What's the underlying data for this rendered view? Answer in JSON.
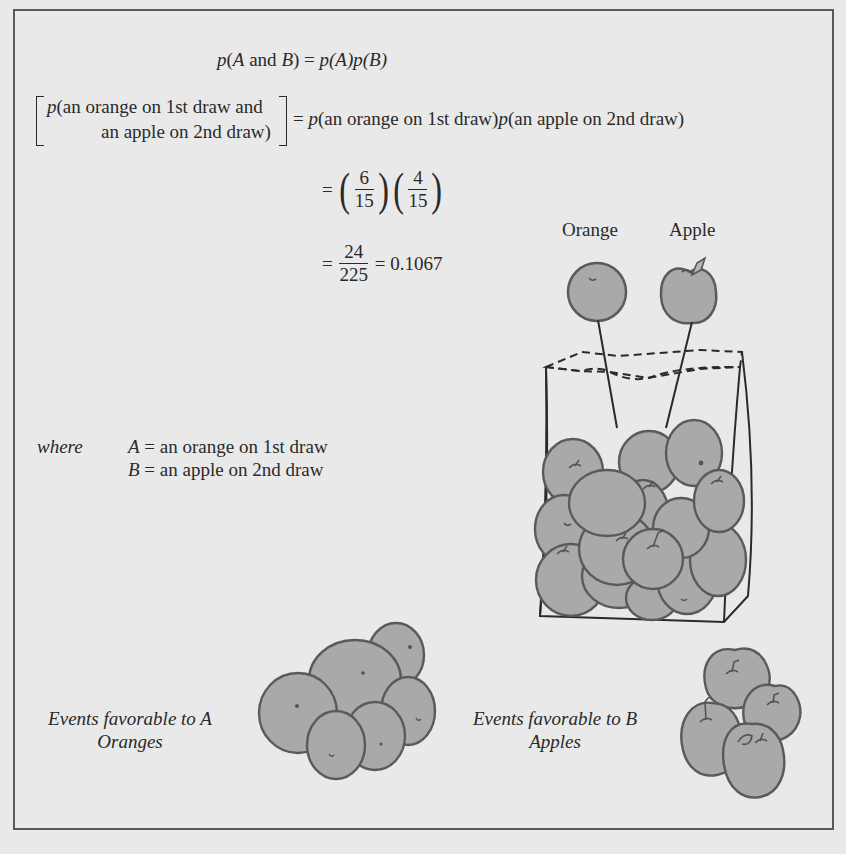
{
  "equations": {
    "rule": {
      "lhs_p": "p",
      "lhs_open": "(",
      "lhs_A": "A",
      "lhs_and": " and ",
      "lhs_B": "B",
      "lhs_close": ")",
      "eq": " = ",
      "rhs": "p(A)p(B)"
    },
    "applied": {
      "bracket_line1_p": "p",
      "bracket_line1_rest": "(an orange on 1st draw and",
      "bracket_line2": "an apple on 2nd draw)",
      "eq": "=",
      "rhs_p1": "p",
      "rhs_part1": "(an orange on 1st draw)",
      "rhs_p2": "p",
      "rhs_part2": "(an apple on 2nd draw)"
    },
    "product": {
      "eq": "=",
      "frac1_num": "6",
      "frac1_den": "15",
      "frac2_num": "4",
      "frac2_den": "15"
    },
    "result": {
      "eq": "=",
      "num": "24",
      "den": "225",
      "eq2": "=",
      "value": "0.1067"
    }
  },
  "definitions": {
    "where_label": "where",
    "A_symbol": "A",
    "A_def": " = an orange on 1st draw",
    "B_symbol": "B",
    "B_def": " = an apple on 2nd draw"
  },
  "labels": {
    "orange": "Orange",
    "apple": "Apple",
    "events_A_line1": "Events favorable to A",
    "events_A_line2": "Oranges",
    "events_B_line1": "Events favorable to B",
    "events_B_line2": "Apples"
  },
  "illustration": {
    "bag_contents": {
      "oranges": 6,
      "apples": 4,
      "total_visible_fruit": 15
    },
    "fruit_fill": "#a9a9a9",
    "fruit_stroke": "#555555",
    "line_color": "#2a2a2a"
  }
}
